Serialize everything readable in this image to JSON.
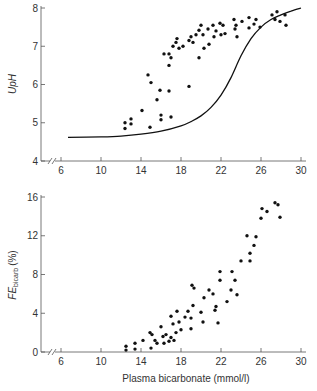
{
  "chart_data": [
    {
      "type": "scatter",
      "title": "",
      "xlabel": "",
      "ylabel": "UpH",
      "xlim": [
        4,
        31
      ],
      "ylim": [
        4,
        8
      ],
      "xticks": [
        6,
        10,
        14,
        18,
        22,
        26,
        30
      ],
      "yticks": [
        4,
        5,
        6,
        7,
        8
      ],
      "axis_break": true,
      "grid": false,
      "series": [
        {
          "name": "observed",
          "kind": "scatter",
          "points": [
            [
              12.4,
              5.0
            ],
            [
              12.4,
              4.85
            ],
            [
              13.0,
              5.1
            ],
            [
              13.0,
              4.97
            ],
            [
              14.1,
              5.32
            ],
            [
              14.7,
              6.25
            ],
            [
              15.0,
              6.05
            ],
            [
              14.9,
              4.88
            ],
            [
              15.6,
              5.6
            ],
            [
              15.9,
              5.85
            ],
            [
              16.0,
              5.2
            ],
            [
              16.0,
              5.08
            ],
            [
              16.3,
              6.8
            ],
            [
              16.8,
              6.8
            ],
            [
              16.8,
              6.5
            ],
            [
              16.8,
              5.83
            ],
            [
              17.0,
              6.7
            ],
            [
              17.0,
              5.15
            ],
            [
              17.2,
              7.0
            ],
            [
              17.5,
              7.1
            ],
            [
              17.6,
              7.2
            ],
            [
              17.8,
              6.95
            ],
            [
              18.2,
              7.0
            ],
            [
              18.8,
              7.15
            ],
            [
              18.8,
              5.95
            ],
            [
              19.0,
              7.25
            ],
            [
              19.2,
              7.1
            ],
            [
              19.5,
              7.3
            ],
            [
              19.8,
              6.7
            ],
            [
              19.8,
              7.42
            ],
            [
              20.0,
              7.55
            ],
            [
              20.2,
              7.3
            ],
            [
              20.3,
              6.95
            ],
            [
              20.7,
              7.45
            ],
            [
              20.8,
              7.05
            ],
            [
              21.2,
              7.55
            ],
            [
              21.3,
              7.25
            ],
            [
              21.5,
              7.4
            ],
            [
              21.9,
              7.6
            ],
            [
              22.0,
              7.3
            ],
            [
              22.2,
              7.55
            ],
            [
              22.4,
              7.33
            ],
            [
              23.3,
              7.7
            ],
            [
              23.4,
              7.45
            ],
            [
              23.5,
              7.55
            ],
            [
              23.6,
              7.25
            ],
            [
              24.1,
              7.65
            ],
            [
              24.8,
              7.75
            ],
            [
              24.8,
              7.48
            ],
            [
              25.3,
              7.58
            ],
            [
              25.5,
              7.7
            ],
            [
              25.9,
              7.5
            ],
            [
              27.1,
              7.82
            ],
            [
              27.4,
              7.7
            ],
            [
              27.6,
              7.9
            ],
            [
              27.9,
              7.65
            ],
            [
              28.4,
              7.82
            ],
            [
              28.5,
              7.55
            ]
          ]
        },
        {
          "name": "theoretical curve",
          "kind": "line",
          "points": [
            [
              6.7,
              4.62
            ],
            [
              10,
              4.63
            ],
            [
              12,
              4.65
            ],
            [
              14,
              4.7
            ],
            [
              16,
              4.78
            ],
            [
              18,
              4.92
            ],
            [
              19,
              5.03
            ],
            [
              20,
              5.18
            ],
            [
              21,
              5.4
            ],
            [
              22,
              5.72
            ],
            [
              23,
              6.18
            ],
            [
              24,
              6.75
            ],
            [
              25,
              7.2
            ],
            [
              26,
              7.5
            ],
            [
              27,
              7.7
            ],
            [
              28,
              7.82
            ],
            [
              29,
              7.92
            ],
            [
              30,
              8.0
            ]
          ]
        }
      ]
    },
    {
      "type": "scatter",
      "title": "",
      "xlabel": "Plasma bicarbonate (mmol/l)",
      "ylabel": "FE_bicarb (%)",
      "ylabel_main": "FE",
      "ylabel_sub": "bicarb",
      "ylabel_suffix": " (%)",
      "xlim": [
        4,
        31
      ],
      "ylim": [
        0,
        16
      ],
      "xticks": [
        6,
        10,
        14,
        18,
        22,
        26,
        30
      ],
      "yticks": [
        0,
        4,
        8,
        12,
        16
      ],
      "axis_break": true,
      "grid": false,
      "series": [
        {
          "name": "observed",
          "kind": "scatter",
          "points": [
            [
              12.5,
              0.6
            ],
            [
              12.5,
              0.2
            ],
            [
              13.4,
              0.9
            ],
            [
              13.4,
              0.3
            ],
            [
              14.2,
              1.2
            ],
            [
              14.9,
              2.0
            ],
            [
              15.1,
              1.8
            ],
            [
              15.0,
              0.4
            ],
            [
              15.4,
              1.2
            ],
            [
              15.6,
              0.9
            ],
            [
              16.0,
              2.6
            ],
            [
              16.2,
              1.6
            ],
            [
              16.3,
              0.9
            ],
            [
              16.5,
              1.8
            ],
            [
              16.8,
              1.1
            ],
            [
              17.0,
              1.5
            ],
            [
              17.0,
              3.7
            ],
            [
              17.2,
              2.9
            ],
            [
              17.3,
              1.2
            ],
            [
              17.5,
              2.0
            ],
            [
              17.6,
              4.2
            ],
            [
              17.8,
              3.1
            ],
            [
              18.0,
              2.3
            ],
            [
              18.4,
              3.6
            ],
            [
              18.7,
              4.2
            ],
            [
              19.0,
              3.5
            ],
            [
              19.0,
              2.4
            ],
            [
              19.1,
              6.9
            ],
            [
              19.3,
              6.6
            ],
            [
              19.2,
              4.8
            ],
            [
              20.0,
              4.1
            ],
            [
              20.2,
              3.1
            ],
            [
              20.3,
              5.6
            ],
            [
              20.8,
              6.4
            ],
            [
              21.2,
              6.0
            ],
            [
              21.5,
              4.7
            ],
            [
              21.4,
              4.3
            ],
            [
              21.7,
              3.0
            ],
            [
              21.9,
              8.3
            ],
            [
              21.9,
              7.4
            ],
            [
              22.6,
              5.2
            ],
            [
              23.0,
              6.4
            ],
            [
              23.1,
              8.3
            ],
            [
              23.4,
              7.4
            ],
            [
              23.6,
              5.9
            ],
            [
              24.0,
              9.4
            ],
            [
              24.6,
              12.0
            ],
            [
              24.9,
              9.4
            ],
            [
              24.9,
              10.2
            ],
            [
              25.3,
              11.0
            ],
            [
              25.5,
              11.9
            ],
            [
              26.0,
              13.8
            ],
            [
              26.1,
              14.8
            ],
            [
              26.6,
              14.5
            ],
            [
              27.4,
              15.4
            ],
            [
              27.7,
              15.2
            ],
            [
              27.9,
              13.9
            ]
          ]
        }
      ]
    }
  ],
  "figure": {
    "top_ylabel": "UpH",
    "bottom_ylabel_main": "FE",
    "bottom_ylabel_sub": "bicarb",
    "bottom_ylabel_suffix": "(%)",
    "xlabel": "Plasma bicarbonate (mmol/l)"
  }
}
